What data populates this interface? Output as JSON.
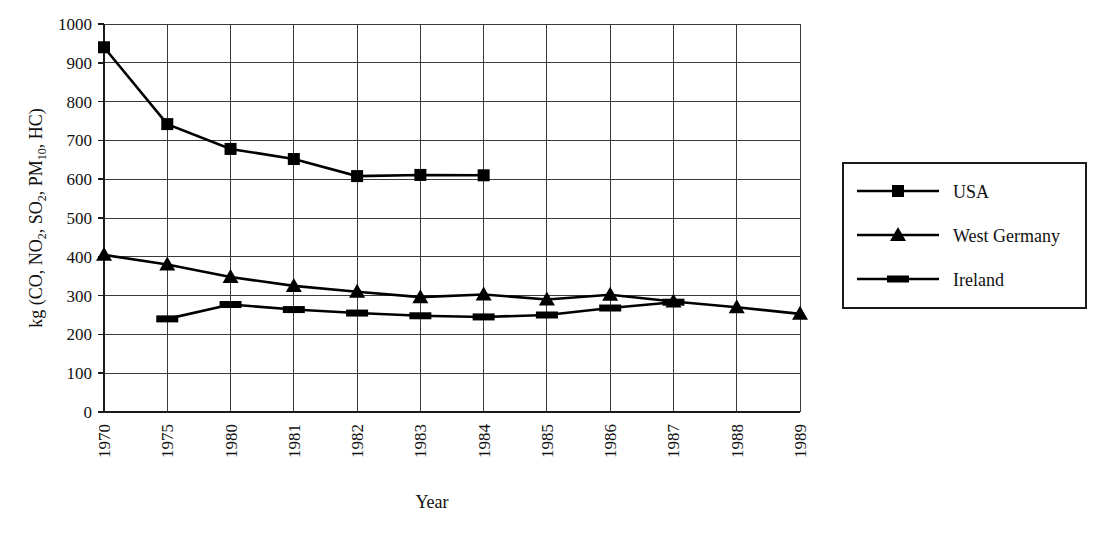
{
  "chart_data": {
    "type": "line",
    "title": "",
    "xlabel": "Year",
    "ylabel": "kg (CO, NO2, SO2, PM10, HC)",
    "ylabel_parts": [
      {
        "text": "kg (CO, NO",
        "sub": false
      },
      {
        "text": "2",
        "sub": true
      },
      {
        "text": ", SO",
        "sub": false
      },
      {
        "text": "2",
        "sub": true
      },
      {
        "text": ", PM",
        "sub": false
      },
      {
        "text": "10",
        "sub": true
      },
      {
        "text": ", HC)",
        "sub": false
      }
    ],
    "categories": [
      "1970",
      "1975",
      "1980",
      "1981",
      "1982",
      "1983",
      "1984",
      "1985",
      "1986",
      "1987",
      "1988",
      "1989"
    ],
    "ylim": [
      0,
      1000
    ],
    "ytick_step": 100,
    "yticks": [
      "0",
      "100",
      "200",
      "300",
      "400",
      "500",
      "600",
      "700",
      "800",
      "900",
      "1000"
    ],
    "grid": true,
    "legend_position": "right",
    "series": [
      {
        "name": "USA",
        "marker": "square",
        "values": [
          940,
          742,
          678,
          652,
          608,
          611,
          610,
          null,
          null,
          null,
          null,
          null
        ]
      },
      {
        "name": "West Germany",
        "marker": "triangle",
        "values": [
          405,
          380,
          348,
          325,
          310,
          296,
          303,
          290,
          302,
          285,
          270,
          253
        ]
      },
      {
        "name": "Ireland",
        "marker": "dash",
        "values": [
          null,
          240,
          277,
          264,
          255,
          248,
          245,
          250,
          268,
          283,
          null,
          null
        ]
      }
    ]
  },
  "legend": {
    "items": [
      {
        "label": "USA",
        "marker": "square"
      },
      {
        "label": "West Germany",
        "marker": "triangle"
      },
      {
        "label": "Ireland",
        "marker": "dash"
      }
    ]
  },
  "colors": {
    "ink": "#000000",
    "grid": "#3a3a3a",
    "background": "#ffffff"
  }
}
